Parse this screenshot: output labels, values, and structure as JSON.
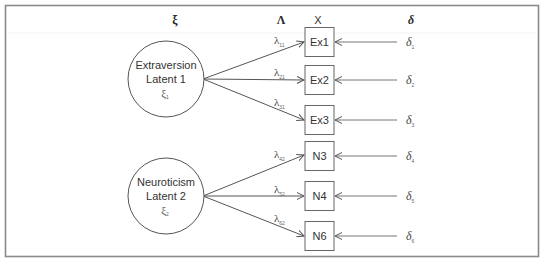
{
  "headers": {
    "latent": "ξ",
    "loadings": "Λ",
    "observed": "X",
    "errors": "δ"
  },
  "latents": [
    {
      "name": "Extraversion",
      "label": "Latent 1",
      "symbol": "ξ",
      "subscript": "1"
    },
    {
      "name": "Neuroticism",
      "label": "Latent 2",
      "symbol": "ξ",
      "subscript": "2"
    }
  ],
  "indicators": [
    {
      "label": "Ex1",
      "latent": 0,
      "loading_symbol": "λ",
      "loading_sub": "11",
      "error_symbol": "δ",
      "error_sub": "1"
    },
    {
      "label": "Ex2",
      "latent": 0,
      "loading_symbol": "λ",
      "loading_sub": "21",
      "error_symbol": "δ",
      "error_sub": "2"
    },
    {
      "label": "Ex3",
      "latent": 0,
      "loading_symbol": "λ",
      "loading_sub": "31",
      "error_symbol": "δ",
      "error_sub": "3"
    },
    {
      "label": "N3",
      "latent": 1,
      "loading_symbol": "λ",
      "loading_sub": "42",
      "error_symbol": "δ",
      "error_sub": "4"
    },
    {
      "label": "N4",
      "latent": 1,
      "loading_symbol": "λ",
      "loading_sub": "52",
      "error_symbol": "δ",
      "error_sub": "5"
    },
    {
      "label": "N6",
      "latent": 1,
      "loading_symbol": "λ",
      "loading_sub": "62",
      "error_symbol": "δ",
      "error_sub": "6"
    }
  ],
  "colors": {
    "frame": "#8a8a8a",
    "stroke": "#555555",
    "text": "#333333"
  }
}
